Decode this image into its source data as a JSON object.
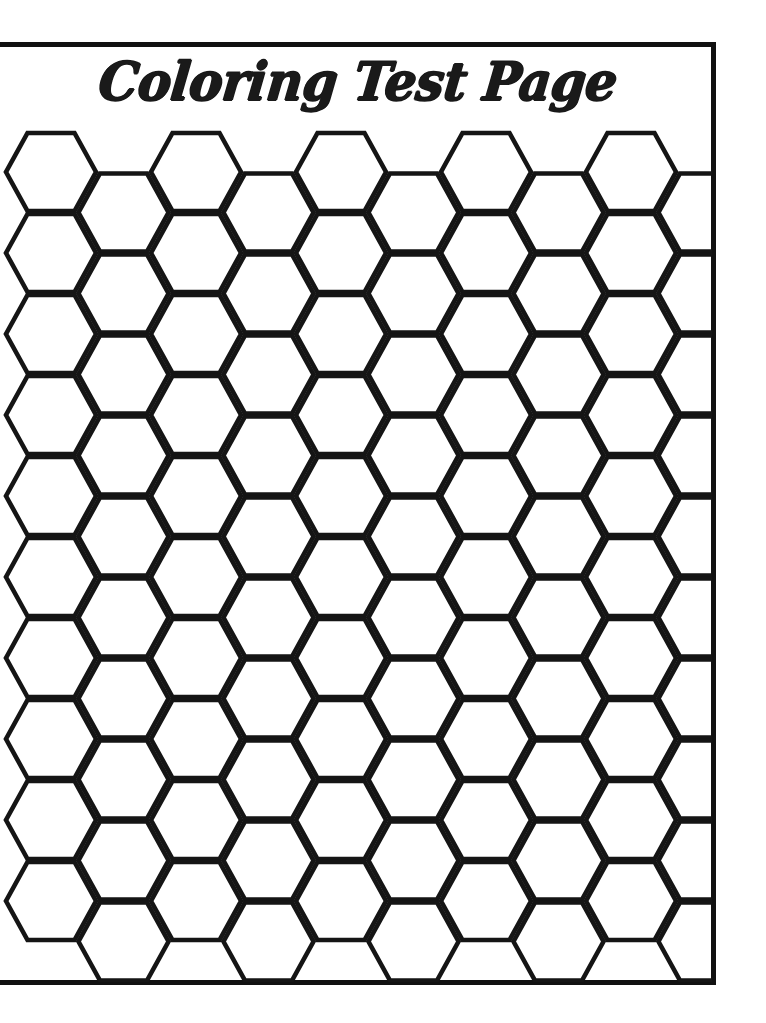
{
  "document": {
    "title": "Coloring Test Page",
    "kind": "printable-coloring-page",
    "background_color": "#ffffff",
    "ink_color": "#151515"
  },
  "page_border": {
    "color": "#111111",
    "thickness_px": 5,
    "left_px": -8,
    "top_px": 42,
    "width_px": 724,
    "height_px": 943,
    "left_edge_cropped": true
  },
  "title": {
    "text": "Coloring Test Page",
    "style": "brush-script-bold",
    "color": "#1a1a1a",
    "align": "center"
  },
  "honeycomb": {
    "shape": "hexagon",
    "orientation": "flat-top",
    "stroke_color": "#151515",
    "stroke_width_px": 4.6,
    "fill": "none",
    "columns": 10,
    "rows_per_column": 10,
    "column_pitch_px": 72.5,
    "row_pitch_px": 81,
    "odd_column_offset_px": 40.5,
    "hex_width_px": 90,
    "hex_height_px": 78,
    "flat_top_width_px": 47,
    "origin_x_px": 51,
    "origin_y_px": 172,
    "clip_top_px": 46,
    "clip_bottom_px": 982,
    "clip_right_px": 712
  },
  "chart_data": {
    "type": "table",
    "title": "Coloring Test Page",
    "categories": [
      "columns",
      "rows_per_column",
      "total_hexagons"
    ],
    "values": [
      10,
      10,
      100
    ]
  }
}
